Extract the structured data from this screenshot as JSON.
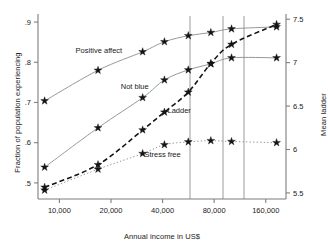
{
  "chart_data": {
    "type": "line",
    "title": "",
    "xlabel": "Annual income in US$",
    "ylabel": "Fraction of population experiencing",
    "ylabel_right": "Mean ladder",
    "x_scale": "log",
    "xlim": [
      7500,
      210000
    ],
    "ylim": [
      0.46,
      0.92
    ],
    "ylim_right": [
      5.43,
      7.56
    ],
    "grid": false,
    "legend": "inline-annotations",
    "xticks": [
      10000,
      20000,
      40000,
      80000,
      160000
    ],
    "xtick_labels": [
      "10,000",
      "20,000",
      "40,000",
      "80,000",
      "160,000"
    ],
    "yticks_left": [
      0.5,
      0.6,
      0.7,
      0.8,
      0.9
    ],
    "ytick_labels_left": [
      ".5",
      ".6",
      ".7",
      ".8",
      ".9"
    ],
    "yticks_right": [
      5.5,
      6,
      6.5,
      7,
      7.5
    ],
    "ytick_labels_right": [
      "5.5",
      "6",
      "6.5",
      "7",
      "7.5"
    ],
    "vertical_reference_lines": [
      63000,
      86000,
      113000
    ],
    "x": [
      8200,
      16800,
      30600,
      41000,
      56500,
      76500,
      101000,
      185000
    ],
    "series": [
      {
        "name": "Positive affect",
        "axis": "left",
        "label_x": 17000,
        "label_y": 0.822,
        "line_style": "solid",
        "values": [
          0.704,
          0.78,
          0.826,
          0.851,
          0.866,
          0.874,
          0.883,
          0.888
        ]
      },
      {
        "name": "Not blue",
        "axis": "left",
        "label_x": 27500,
        "label_y": 0.733,
        "line_style": "solid",
        "values": [
          0.539,
          0.637,
          0.712,
          0.756,
          0.781,
          0.796,
          0.811,
          0.811
        ]
      },
      {
        "name": "Ladder",
        "axis": "right",
        "label_x": 50000,
        "label_y": 6.42,
        "line_style": "dashed",
        "values": [
          5.565,
          5.825,
          6.225,
          6.43,
          6.66,
          6.99,
          7.21,
          7.44
        ]
      },
      {
        "name": "Stress free",
        "axis": "left",
        "label_x": 40000,
        "label_y": 0.565,
        "line_style": "dotted",
        "values": [
          0.482,
          0.534,
          0.573,
          0.595,
          0.602,
          0.605,
          0.603,
          0.6
        ]
      }
    ]
  },
  "colors": {
    "axis": "#808080",
    "series_line": "#8c8c8c",
    "marker": "#141414",
    "reference_line": "#999999",
    "text": "#1a1a1a",
    "background": "#ffffff"
  }
}
